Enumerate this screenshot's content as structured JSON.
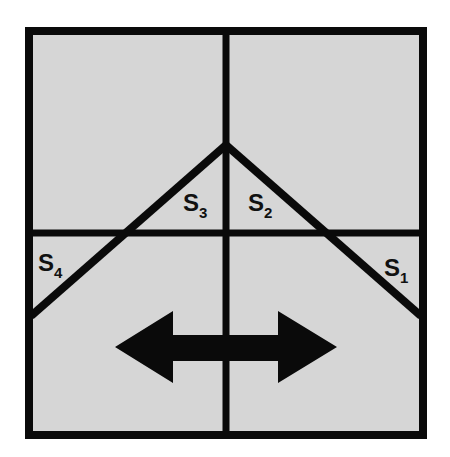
{
  "diagram": {
    "background": "#ffffff",
    "panel_fill": "#d6d6d6",
    "line_color": "#0a0a0a",
    "labels": [
      {
        "id": "s1",
        "main": "S",
        "sub": "1",
        "x": 384,
        "y": 279
      },
      {
        "id": "s2",
        "main": "S",
        "sub": "2",
        "x": 248,
        "y": 214
      },
      {
        "id": "s3",
        "main": "S",
        "sub": "3",
        "x": 183,
        "y": 214
      },
      {
        "id": "s4",
        "main": "S",
        "sub": "4",
        "x": 38,
        "y": 279
      }
    ],
    "arrow": {
      "direction": "left-right",
      "description": "double-headed horizontal arrow"
    }
  }
}
